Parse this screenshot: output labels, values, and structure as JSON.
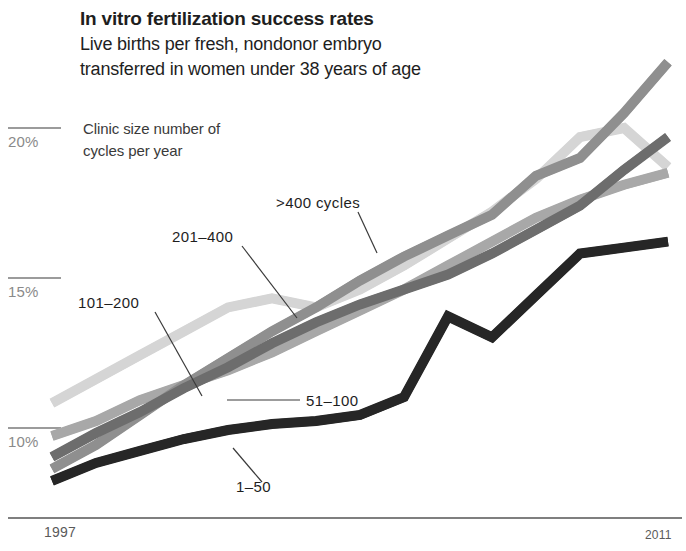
{
  "header": {
    "title": "In vitro fertilization success rates",
    "subtitle": "Live births per fresh, nondonor embryo\ntransferred in women under 38 years of age",
    "legend_note": "Clinic size number of\ncycles per year"
  },
  "axis": {
    "y_ticks": [
      "20%",
      "15%",
      "10%"
    ],
    "x_start": "1997",
    "x_end": "2011"
  },
  "series_labels": {
    "gt400": ">400 cycles",
    "s201_400": "201–400",
    "s101_200": "101–200",
    "s51_100": "51–100",
    "s1_50": "1–50"
  },
  "colors": {
    "s1_50": "#262626",
    "s51_100": "#6d6d6d",
    "s101_200": "#a8a8a8",
    "s201_400": "#8f8f8f",
    "gt400": "#d5d5d5",
    "axis": "#555555",
    "tick": "#9b9b9b",
    "text": "#1e1e1e"
  },
  "chart_data": {
    "type": "line",
    "title": "In vitro fertilization success rates",
    "subtitle": "Live births per fresh, nondonor embryo transferred in women under 38 years of age",
    "xlabel": "",
    "ylabel": "",
    "x": [
      1997,
      1998,
      1999,
      2000,
      2001,
      2002,
      2003,
      2004,
      2005,
      2006,
      2007,
      2008,
      2009,
      2010,
      2011
    ],
    "xlim": [
      1997,
      2011
    ],
    "ylim": [
      8.0,
      23.0
    ],
    "yticks": [
      10,
      15,
      20
    ],
    "ytick_labels": [
      "10%",
      "15%",
      "20%"
    ],
    "grid": false,
    "legend": "inline-annotations",
    "series": [
      {
        "name": "1–50",
        "label": ">1-50",
        "color": "#262626",
        "values": [
          8.2,
          8.8,
          9.2,
          9.6,
          9.9,
          10.1,
          10.2,
          10.4,
          11.0,
          13.7,
          13.0,
          14.4,
          15.8,
          16.0,
          16.2
        ]
      },
      {
        "name": "51–100",
        "color": "#6d6d6d",
        "values": [
          9.0,
          9.8,
          10.5,
          11.3,
          12.0,
          12.8,
          13.5,
          14.1,
          14.6,
          15.1,
          15.8,
          16.6,
          17.4,
          18.6,
          19.7
        ]
      },
      {
        "name": "101–200",
        "color": "#a8a8a8",
        "values": [
          9.7,
          10.2,
          10.9,
          11.4,
          11.9,
          12.5,
          13.2,
          13.9,
          14.6,
          15.4,
          16.2,
          17.0,
          17.6,
          18.1,
          18.5
        ]
      },
      {
        "name": "201–400",
        "color": "#8f8f8f",
        "values": [
          8.6,
          9.4,
          10.4,
          11.4,
          12.3,
          13.2,
          14.0,
          14.9,
          15.7,
          16.4,
          17.1,
          18.4,
          19.0,
          20.5,
          22.2
        ]
      },
      {
        "name": ">400 cycles",
        "color": "#d5d5d5",
        "values": [
          10.8,
          11.6,
          12.4,
          13.2,
          14.0,
          14.3,
          14.0,
          14.6,
          15.4,
          16.3,
          17.2,
          18.3,
          19.7,
          20.0,
          18.7
        ]
      }
    ],
    "annotations": [
      {
        "text": ">400 cycles",
        "x_px": 278,
        "y_px": 204
      },
      {
        "text": "201–400",
        "x_px": 172,
        "y_px": 237
      },
      {
        "text": "101–200",
        "x_px": 80,
        "y_px": 303
      },
      {
        "text": "51–100",
        "x_px": 308,
        "y_px": 404
      },
      {
        "text": "1–50",
        "x_px": 238,
        "y_px": 489
      }
    ]
  }
}
